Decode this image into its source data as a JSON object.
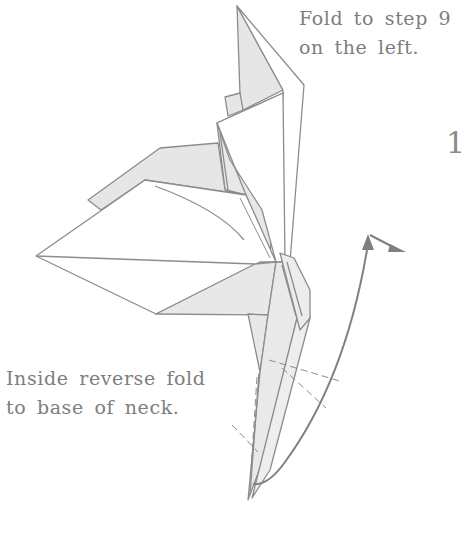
{
  "diagram": {
    "type": "origami-fold-instruction",
    "step_number": "1",
    "instructions": [
      {
        "id": "top",
        "lines": [
          "Fold to step 9",
          "on the left."
        ]
      },
      {
        "id": "bottom",
        "lines": [
          "Inside reverse fold",
          "to base of neck."
        ]
      }
    ],
    "colors": {
      "line": "#8c8c8c",
      "shaded_paper": "#e8e8e8",
      "white_paper": "#ffffff",
      "text": "#7e7e7e",
      "arrow": "#808080"
    },
    "elements": [
      "origami-crane-model",
      "valley-fold-dashed-lines",
      "curved-fold-arrow",
      "push-arrow"
    ]
  }
}
